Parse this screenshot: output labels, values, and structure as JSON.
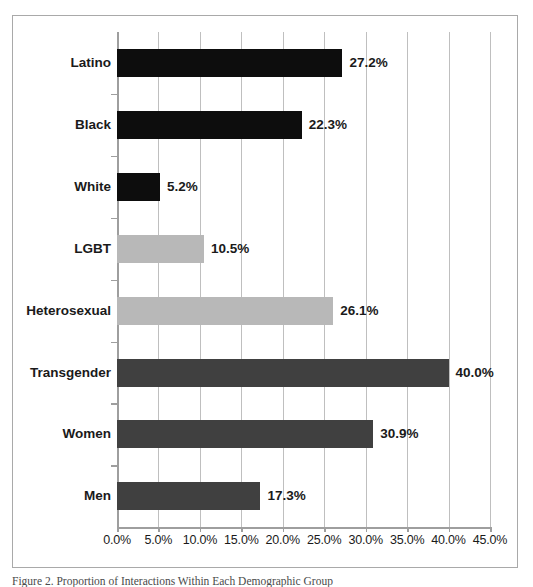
{
  "figure": {
    "caption": "Figure 2. Proportion of Interactions Within Each Demographic Group",
    "border_color": "#a9a9a9",
    "background": "#ffffff"
  },
  "chart_data": {
    "type": "bar",
    "orientation": "horizontal",
    "title": "",
    "xlabel": "",
    "ylabel": "",
    "categories": [
      "Latino",
      "Black",
      "White",
      "LGBT",
      "Heterosexual",
      "Transgender",
      "Women",
      "Men"
    ],
    "values": [
      27.2,
      22.3,
      5.2,
      10.5,
      26.1,
      40.0,
      30.9,
      17.3
    ],
    "value_labels": [
      "27.2%",
      "22.3%",
      "5.2%",
      "10.5%",
      "26.1%",
      "40.0%",
      "30.9%",
      "17.3%"
    ],
    "bar_colors": [
      "#0d0d0d",
      "#0d0d0d",
      "#0d0d0d",
      "#b8b8b8",
      "#b8b8b8",
      "#404040",
      "#404040",
      "#404040"
    ],
    "xlim": [
      0,
      45
    ],
    "xticks": [
      0,
      5,
      10,
      15,
      20,
      25,
      30,
      35,
      40,
      45
    ],
    "xtick_labels": [
      "0.0%",
      "5.0%",
      "10.0%",
      "15.0%",
      "20.0%",
      "25.0%",
      "30.0%",
      "35.0%",
      "40.0%",
      "45.0%"
    ],
    "grid": {
      "vertical": true,
      "horizontal": false,
      "color": "#bfbfbf"
    },
    "legend": {
      "visible": false
    }
  }
}
